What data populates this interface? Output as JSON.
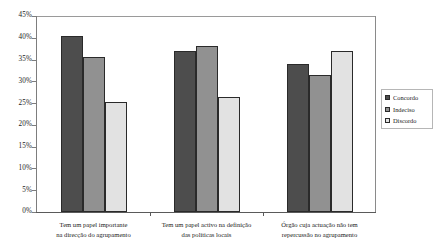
{
  "chart_data": {
    "type": "bar",
    "title": "",
    "subtitle": "",
    "xlabel": "",
    "ylabel": "",
    "ylim": [
      0,
      45
    ],
    "ytick_labels": [
      "45%",
      "40%",
      "35%",
      "30%",
      "25%",
      "20%",
      "15%",
      "10%",
      "5%",
      "0%"
    ],
    "ytick_values": [
      45,
      40,
      35,
      30,
      25,
      20,
      15,
      10,
      5,
      0
    ],
    "grid": false,
    "legend_position": "right",
    "categories": [
      "Tem um papel importante na direcção do agrupamento",
      "Tem um papel activo na definição das políticas locais",
      "Órgão cuja actuação não tem repercussão no agrupamento"
    ],
    "category_lines": [
      [
        "Tem um papel importante",
        "na direcção do agrupamento"
      ],
      [
        "Tem um papel activo na definição",
        "das políticas locais"
      ],
      [
        "Órgão cuja actuação não tem",
        "repercussão no agrupamento"
      ]
    ],
    "series": [
      {
        "name": "Concordo",
        "color": "#4d4d4d",
        "values": [
          40.5,
          37.0,
          34.0
        ]
      },
      {
        "name": "Indeciso",
        "color": "#919191",
        "values": [
          35.7,
          38.2,
          31.5
        ]
      },
      {
        "name": "Discordo",
        "color": "#e2e2e2",
        "values": [
          25.3,
          26.5,
          37.0
        ]
      }
    ]
  },
  "legend": {
    "items": [
      {
        "label": "Concordo"
      },
      {
        "label": "Indeciso"
      },
      {
        "label": "Discordo"
      }
    ]
  }
}
